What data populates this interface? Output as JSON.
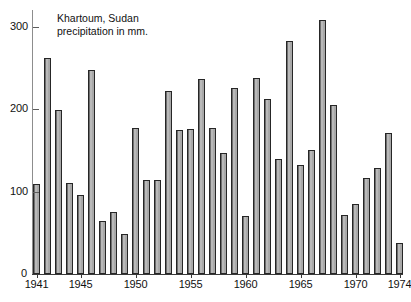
{
  "chart_data": {
    "type": "bar",
    "title": "Khartoum, Sudan",
    "subtitle": "precipitation in mm.",
    "xlabel": "",
    "ylabel": "",
    "ylim": [
      0,
      320
    ],
    "grid": false,
    "legend": "none",
    "y_ticks": [
      0,
      100,
      200,
      300
    ],
    "y_tick_labels": [
      "0",
      "100",
      "200",
      "300"
    ],
    "x_tick_labels": [
      "1941",
      "1945",
      "1950",
      "1955",
      "1960",
      "1965",
      "1970",
      "1974"
    ],
    "x_tick_years": [
      1941,
      1945,
      1950,
      1955,
      1960,
      1965,
      1970,
      1974
    ],
    "categories": [
      1941,
      1942,
      1943,
      1944,
      1945,
      1946,
      1947,
      1948,
      1949,
      1950,
      1951,
      1952,
      1953,
      1954,
      1955,
      1956,
      1957,
      1958,
      1959,
      1960,
      1961,
      1962,
      1963,
      1964,
      1965,
      1966,
      1967,
      1968,
      1969,
      1970,
      1971,
      1972,
      1973,
      1974
    ],
    "values": [
      109,
      262,
      199,
      110,
      96,
      247,
      64,
      75,
      49,
      177,
      114,
      114,
      222,
      174,
      176,
      236,
      177,
      147,
      225,
      70,
      238,
      212,
      139,
      282,
      132,
      150,
      308,
      205,
      72,
      85,
      116,
      128,
      171,
      38
    ],
    "colors": {
      "bar_fill": "#a8a8a8",
      "bar_edge": "#262626",
      "axis": "#3a3a3a",
      "background": "#ffffff",
      "text": "#111111"
    }
  }
}
